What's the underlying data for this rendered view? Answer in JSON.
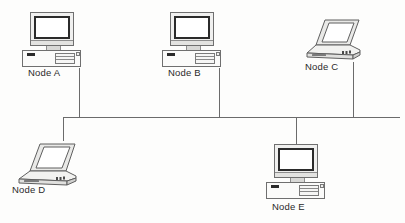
{
  "diagram": {
    "background_color": "#fdfdfc",
    "line_color": "#6b6b6b",
    "label_color": "#2a2a2a",
    "nodes": [
      {
        "id": "a",
        "label": "Node A",
        "device": "desktop-computer",
        "label_x": 28,
        "label_y": 67,
        "device_x": 22,
        "device_y": 12
      },
      {
        "id": "b",
        "label": "Node B",
        "device": "desktop-computer",
        "label_x": 168,
        "label_y": 67,
        "device_x": 162,
        "device_y": 12
      },
      {
        "id": "c",
        "label": "Node C",
        "device": "laptop-computer",
        "label_x": 305,
        "label_y": 61,
        "device_x": 303,
        "device_y": 14
      },
      {
        "id": "d",
        "label": "Node D",
        "device": "laptop-computer",
        "label_x": 12,
        "label_y": 184,
        "device_x": 12,
        "device_y": 138
      },
      {
        "id": "e",
        "label": "Node E",
        "device": "desktop-computer",
        "label_x": 272,
        "label_y": 201,
        "device_x": 266,
        "device_y": 144
      }
    ],
    "bus": {
      "main_segment": {
        "x1": 63,
        "y1": 117,
        "x2": 400,
        "y2": 117
      },
      "left_riser": {
        "x1": 63,
        "y1": 117,
        "x2": 63,
        "y2": 140
      },
      "drops": [
        {
          "node": "a",
          "x": 79,
          "y1": 68,
          "y2": 117
        },
        {
          "node": "b",
          "x": 219,
          "y1": 68,
          "y2": 117
        },
        {
          "node": "c",
          "x": 353,
          "y1": 62,
          "y2": 117
        },
        {
          "node": "e",
          "x": 296,
          "y1": 117,
          "y2": 147
        }
      ]
    }
  }
}
